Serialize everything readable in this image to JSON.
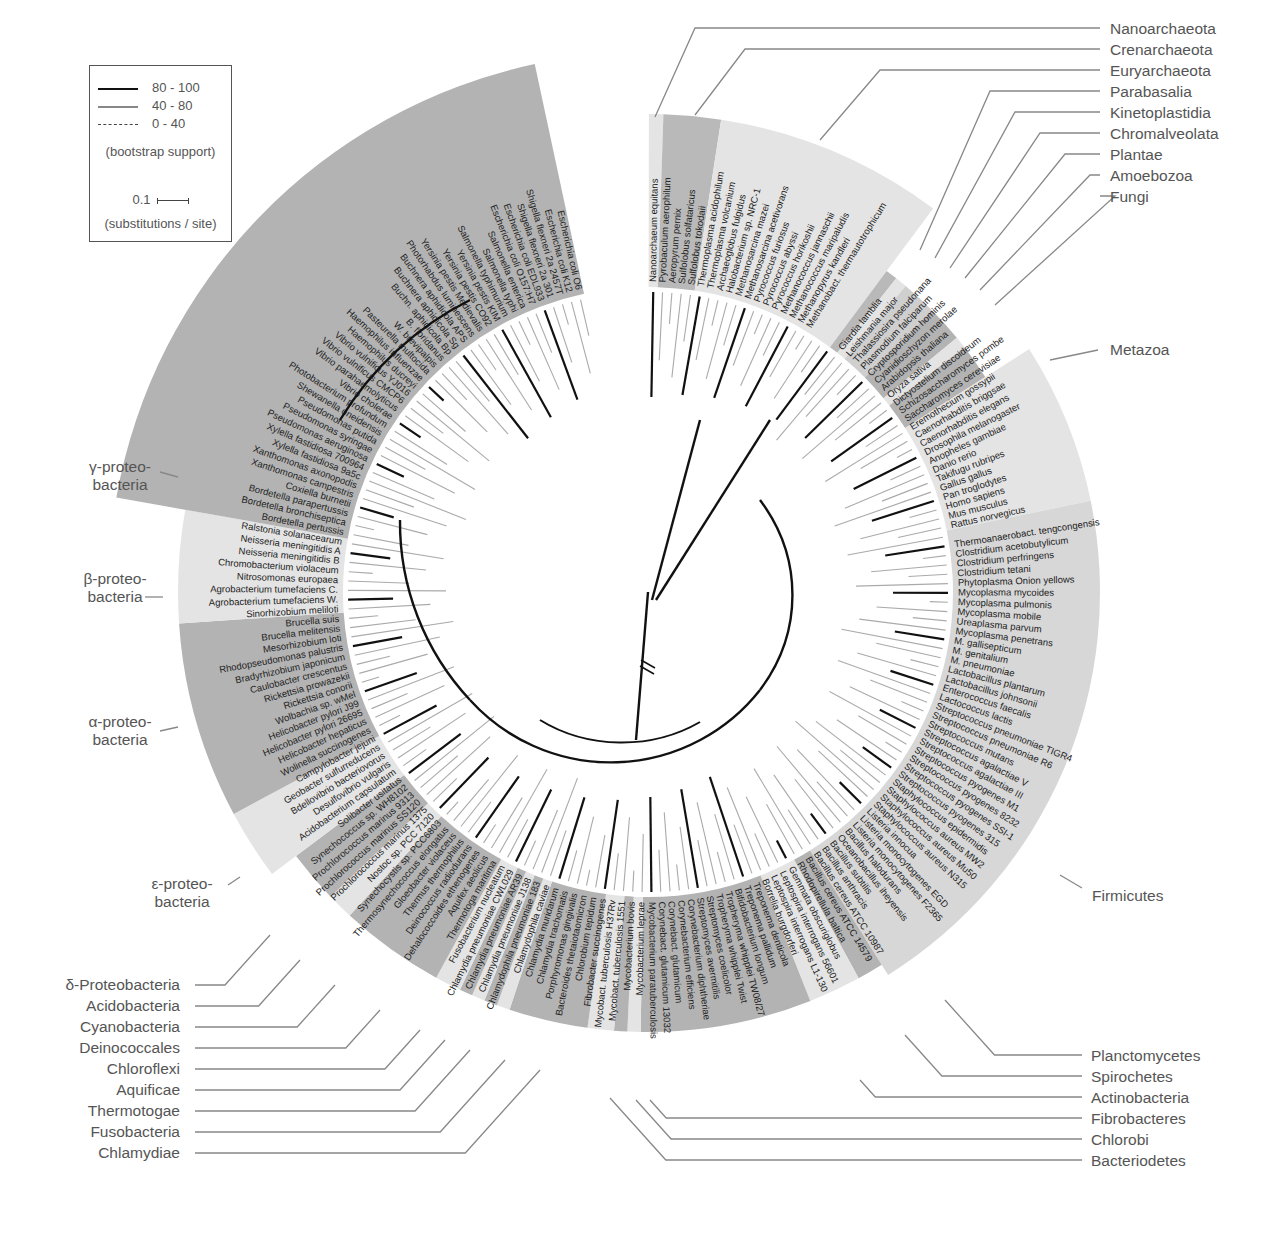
{
  "legend": {
    "support_entries": [
      {
        "label": "80 - 100",
        "style": "solid-thick",
        "color": "#111111"
      },
      {
        "label": "40 - 80",
        "style": "solid-gray",
        "color": "#777777"
      },
      {
        "label": "0 - 40",
        "style": "dashed",
        "color": "#555555"
      }
    ],
    "support_caption": "(bootstrap support)",
    "scale_value": "0.1",
    "scale_caption": "(substitutions / site)"
  },
  "groups_right": [
    "Nanoarchaeota",
    "Crenarchaeota",
    "Euryarchaeota",
    "Parabasalia",
    "Kinetoplastidia",
    "Chromalveolata",
    "Plantae",
    "Amoebozoa",
    "Fungi"
  ],
  "groups_metazoa": "Metazoa",
  "groups_firmicutes": "Firmicutes",
  "groups_bottom_right": [
    "Planctomycetes",
    "Spirochetes",
    "Actinobacteria",
    "Fibrobacteres",
    "Chlorobi",
    "Bacteriodetes"
  ],
  "groups_bottom_left": [
    "δ-Proteobacteria",
    "Acidobacteria",
    "Cyanobacteria",
    "Deinococcales",
    "Chloroflexi",
    "Aquificae",
    "Thermotogae",
    "Fusobacteria",
    "Chlamydiae"
  ],
  "groups_left": [
    {
      "line1": "γ-proteo-",
      "line2": "bacteria"
    },
    {
      "line1": "β-proteo-",
      "line2": "bacteria"
    },
    {
      "line1": "α-proteo-",
      "line2": "bacteria"
    },
    {
      "line1": "ε-proteo-",
      "line2": "bacteria"
    }
  ],
  "sectors": [
    {
      "name": "Nanoarchaeota",
      "count": 1,
      "shade": "#e4e4e4",
      "outer": 478
    },
    {
      "name": "Crenarchaeota",
      "count": 4,
      "shade": "#b9b9b9",
      "outer": 478
    },
    {
      "name": "Euryarchaeota",
      "count": 16,
      "shade": "#e4e4e4",
      "outer": 478
    },
    {
      "name": "Parabasalia",
      "count": 1,
      "shade": "#b9b9b9",
      "outer": 400
    },
    {
      "name": "Kinetoplastidia",
      "count": 1,
      "shade": "#e4e4e4",
      "outer": 400
    },
    {
      "name": "Chromalveolata",
      "count": 3,
      "shade": "#cfcfcf",
      "outer": 400
    },
    {
      "name": "Plantae",
      "count": 3,
      "shade": "#b3b3b3",
      "outer": 400
    },
    {
      "name": "Amoebozoa",
      "count": 1,
      "shade": "#e4e4e4",
      "outer": 400
    },
    {
      "name": "Fungi",
      "count": 3,
      "shade": "#b3b3b3",
      "outer": 400
    },
    {
      "name": "Metazoa",
      "count": 12,
      "shade": "#e4e4e4",
      "outer": 452
    },
    {
      "name": "Firmicutes",
      "count": 40,
      "shade": "#d7d7d7",
      "outer": 452
    },
    {
      "name": "Planctomycetes",
      "count": 2,
      "shade": "#b3b3b3",
      "outer": 440
    },
    {
      "name": "Spirochetes",
      "count": 4,
      "shade": "#e4e4e4",
      "outer": 440
    },
    {
      "name": "Actinobacteria",
      "count": 13,
      "shade": "#b3b3b3",
      "outer": 440
    },
    {
      "name": "Fibrobacteres",
      "count": 1,
      "shade": "#e4e4e4",
      "outer": 440
    },
    {
      "name": "Chlorobi",
      "count": 1,
      "shade": "#b3b3b3",
      "outer": 440
    },
    {
      "name": "Bacteriodetes",
      "count": 2,
      "shade": "#e4e4e4",
      "outer": 440
    },
    {
      "name": "Chlamydiae",
      "count": 6,
      "shade": "#b3b3b3",
      "outer": 440
    },
    {
      "name": "Fusobacteria",
      "count": 1,
      "shade": "#e4e4e4",
      "outer": 440
    },
    {
      "name": "Thermotogae",
      "count": 1,
      "shade": "#b3b3b3",
      "outer": 440
    },
    {
      "name": "Aquificae",
      "count": 1,
      "shade": "#e4e4e4",
      "outer": 440
    },
    {
      "name": "Chloroflexi",
      "count": 1,
      "shade": "#b3b3b3",
      "outer": 440
    },
    {
      "name": "Deinococcales",
      "count": 2,
      "shade": "#e4e4e4",
      "outer": 440
    },
    {
      "name": "Cyanobacteria",
      "count": 8,
      "shade": "#b3b3b3",
      "outer": 440
    },
    {
      "name": "Acidobacteria",
      "count": 2,
      "shade": "#e4e4e4",
      "outer": 440
    },
    {
      "name": "δ-Proteobacteria",
      "count": 4,
      "shade": "#b3b3b3",
      "outer": 440
    },
    {
      "name": "ε-proteobacteria",
      "count": 5,
      "shade": "#e4e4e4",
      "outer": 470
    },
    {
      "name": "α-proteobacteria",
      "count": 14,
      "shade": "#b3b3b3",
      "outer": 470
    },
    {
      "name": "β-proteobacteria",
      "count": 8,
      "shade": "#e4e4e4",
      "outer": 470
    },
    {
      "name": "γ-proteobacteria",
      "count": 39,
      "shade": "#b3b3b3",
      "outer": 540
    }
  ],
  "species": [
    "Nanoarchaeum equitans",
    "Pyrobaculum aerophilum",
    "Aeropyrum pernix",
    "Sulfolobus solfataricus",
    "Sulfolobus tokodaii",
    "Thermoplasma acidophilum",
    "Thermoplasma volcanium",
    "Archaeoglobus fulgidus",
    "Halobacterium sp. NRC-1",
    "Methanosarcina mazei",
    "Methanosarcina acetivorans",
    "Pyrococcus furiosus",
    "Pyrococcus abyssi",
    "Pyrococcus horikoshii",
    "Methanococcus jannaschii",
    "Methanococcus maripaludis",
    "Methanopyrus kandleri",
    "Methanobact. thermautotrophicum",
    "",
    "",
    "",
    "Giardia lamblia",
    "Leishmania major",
    "Thalassiosira pseudonana",
    "Plasmodium falciparum",
    "Cryptosporidium hominis",
    "Cyanidioschyzon merolae",
    "Arabidopsis thaliana",
    "Oryza sativa",
    "Dictyostelium discoideum",
    "Schizosaccharomyces pombe",
    "Saccharomyces cerevisiae",
    "Eremothecium gossypii",
    "Caenorhabditis briggsae",
    "Caenorhabditis elegans",
    "Drosophila melanogaster",
    "Anopheles gambiae",
    "Danio rerio",
    "Takifugu rubripes",
    "Gallus gallus",
    "Pan troglodytes",
    "Homo sapiens",
    "Mus musculus",
    "Rattus norvegicus",
    "",
    "Thermoanaerobact. tengcongensis",
    "Clostridium acetobutylicum",
    "Clostridium perfringens",
    "Clostridium tetani",
    "Phytoplasma Onion yellows",
    "Mycoplasma mycoides",
    "Mycoplasma pulmonis",
    "Mycoplasma mobile",
    "Ureaplasma parvum",
    "Mycoplasma penetrans",
    "M. gallisepticum",
    "M. genitalium",
    "M. pneumoniae",
    "Lactobacillus plantarum",
    "Lactobacillus johnsonii",
    "Enterococcus faecalis",
    "Lactococcus lactis",
    "Streptococcus pneumoniae TIGR4",
    "Streptococcus pneumoniae R6",
    "Streptococcus mutans",
    "Streptococcus agalactiae V",
    "Streptococcus agalactiae III",
    "Streptococcus pyogenes M1",
    "Streptococcus pyogenes 8232",
    "Streptococcus pyogenes SSI-1",
    "Streptococcus pyogenes 315",
    "Staphylococcus epidermidis",
    "Staphylococcus aureus MW2",
    "Staphylococcus aureus Mu50",
    "Staphylococcus aureus N315",
    "Listeria innocua",
    "Listeria monocytogenes EGD",
    "Listeria monocytogenes F2365",
    "Bacillus halodurans",
    "Oceanobacillus iheyensis",
    "Bacillus subtilis",
    "Bacillus anthracis",
    "Bacillus cereus ATCC 10987",
    "Bacillus cereus ATCC 14579",
    "Rhodopirellula baltica",
    "Gemmata obscuriglobus",
    "Leptospira interrogans 56601",
    "Leptospira interrogans L1-130",
    "Borrelia burgdorferi",
    "Treponema denticola",
    "Treponema pallidum",
    "Bifidobacterium longum",
    "Tropheryma whipplei TW08/27",
    "Tropheryma whipplei Twist",
    "Streptomyces coelicolor",
    "Streptomyces avermitilis",
    "Corynebacterium diphtheriae",
    "Corynebacterium efficiens",
    "Corynebact. glutamicum",
    "Corynebact. glutamicum 13032",
    "Mycobacterium paratuberculosis",
    "Mycobacterium leprae",
    "Mycobacterium bovis",
    "Mycobact. tuberculosis 1551",
    "Mycobact. tuberculosis H37Rv",
    "Fibrobacter succinogenes",
    "Chlorobium tepidum",
    "Bacteroides thetaiotaomicron",
    "Porphyromonas gingivalis",
    "Chlamydia trachomatis",
    "Chlamydia muridarum",
    "Chlamydophila caviae",
    "Chlamydophila pneumoniae 183",
    "Chlamydia pneumoniae J138",
    "Chlamydia pneumoniae AR39",
    "Chlamydia pneumoniae CWL029",
    "Fusobacterium nucleatum",
    "Thermotoga maritima",
    "Aquifex aeolicus",
    "Dehalococcoides ethenogenes",
    "Deinococcus radiodurans",
    "Thermus thermophilus",
    "Gloeobacter violaceus",
    "Thermosynechococcus elongatus",
    "Synechocystis sp. PCC6803",
    "Nostoc sp. PCC 7120",
    "Prochlorococcus marinus 1375",
    "Prochlorococcus marinus SS120",
    "Prochlorococcus marinus 9313",
    "Synechococcus sp. WH8102",
    "Solibacter usitatus",
    "Acidobacterium capsulatum",
    "Desulfovibrio vulgaris",
    "Bdellovibrio bacteriovorus",
    "Geobacter sulfurreducens",
    "Campylobacter jejuni",
    "Wolinella succinogenes",
    "Helicobacter hepaticus",
    "Helicobacter pylori 26695",
    "Helicobacter pylori J99",
    "Wolbachia sp. wMel",
    "Rickettsia conorii",
    "Rickettsia prowazekii",
    "Caulobacter crescentus",
    "Bradyrhizobium japonicum",
    "Rhodopseudomonas palustris",
    "Mesorhizobium loti",
    "Brucella melitensis",
    "Brucella suis",
    "Sinorhizobium meliloti",
    "Agrobacterium tumefaciens W.",
    "Agrobacterium tumefaciens C.",
    "Nitrosomonas europaea",
    "Chromobacterium violaceum",
    "Neisseria meningitidis B",
    "Neisseria meningitidis A",
    "Ralstonia solanacearum",
    "Bordetella pertussis",
    "Bordetella bronchiseptica",
    "Bordetella parapertussis",
    "Coxiella burnetii",
    "Xanthomonas campestris",
    "Xanthomonas axonopodis",
    "Xylella fastidiosa 9a5c",
    "Xylella fastidiosa 700964",
    "Pseudomonas aeruginosa",
    "Pseudomonas syringae",
    "Pseudomonas putida",
    "Shewanella oneidensis",
    "Photobacterium profundum",
    "Vibrio cholerae",
    "Vibrio parahaemolyticus",
    "Vibrio vulnificus CMCP6",
    "Vibrio vulnificus YJ016",
    "Haemophilus ducreyi",
    "Haemophilus influenzae",
    "Pasteurella multocida",
    "W. brevipalpis",
    "B. floridanus",
    "Buchn. aphidicola Bp",
    "Buchnera aphidicola Sg",
    "Buchnera aphidicola APS",
    "Photorhabdus luminescens",
    "Yersinia pestis Medievalis",
    "Yersinia pestis CO92",
    "Yersinia pestis KIM",
    "Salmonella typhimurium",
    "Salmonella typhi",
    "Salmonella enterica",
    "Escherichia coli O157:H7",
    "Escherichia coli EDL933",
    "Shigella flexneri 2a 301",
    "Shigella flexneri 2a 2457T",
    "Escherichia coli K12",
    "Escherichia coli O6"
  ],
  "layout": {
    "center_x": 648,
    "center_y": 592,
    "leaf_inner_radius": 300,
    "label_radius": 310,
    "band_inner_radius": 305,
    "start_angle_deg": -89,
    "end_angle_deg": 257
  }
}
